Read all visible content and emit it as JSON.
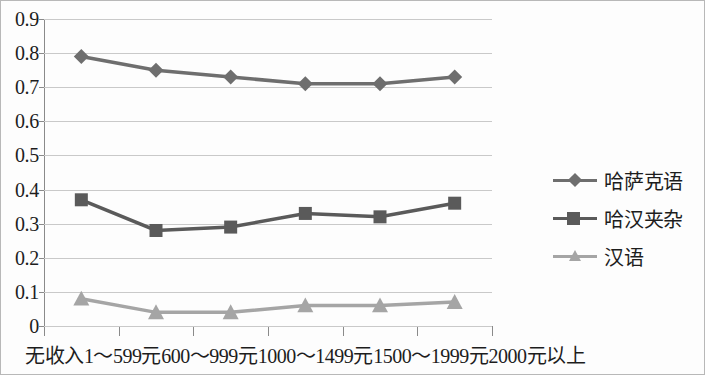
{
  "chart_data": {
    "type": "line",
    "title": "",
    "xlabel": "",
    "ylabel": "",
    "ylim": [
      0,
      0.9
    ],
    "grid": true,
    "legend_position": "right",
    "categories": [
      "无收入",
      "1～599元",
      "600～999元",
      "1000～1499元",
      "1500～1999元",
      "2000元以上"
    ],
    "ytick_labels": [
      "0.9",
      "0.8",
      "0.7",
      "0.6",
      "0.5",
      "0.4",
      "0.3",
      "0.2",
      "0.1",
      "0"
    ],
    "ytick_values": [
      0.9,
      0.8,
      0.7,
      0.6,
      0.5,
      0.4,
      0.3,
      0.2,
      0.1,
      0
    ],
    "series": [
      {
        "name": "哈萨克语",
        "marker": "diamond",
        "color": "#6e6e6e",
        "values": [
          0.79,
          0.75,
          0.73,
          0.71,
          0.71,
          0.73
        ]
      },
      {
        "name": "哈汉夹杂",
        "marker": "square",
        "color": "#5a5a5a",
        "values": [
          0.37,
          0.28,
          0.29,
          0.33,
          0.32,
          0.36
        ]
      },
      {
        "name": "汉语",
        "marker": "triangle",
        "color": "#a5a5a5",
        "values": [
          0.08,
          0.04,
          0.04,
          0.06,
          0.06,
          0.07
        ]
      }
    ]
  },
  "legend": {
    "items": [
      {
        "label": "哈萨克语"
      },
      {
        "label": "哈汉夹杂"
      },
      {
        "label": "汉语"
      }
    ]
  },
  "axis": {
    "y_labels": [
      "0.9",
      "0.8",
      "0.7",
      "0.6",
      "0.5",
      "0.4",
      "0.3",
      "0.2",
      "0.1",
      "0"
    ],
    "x_labels": [
      "无收入",
      "1～599元",
      "600～999元",
      "1000～1499元",
      "1500～1999元",
      "2000元以上"
    ]
  },
  "colors": {
    "grid": "#c9c9c9",
    "axis": "#8a8a8a",
    "series_1": "#6e6e6e",
    "series_2": "#5a5a5a",
    "series_3": "#a5a5a5",
    "text": "#1d1d1d"
  }
}
